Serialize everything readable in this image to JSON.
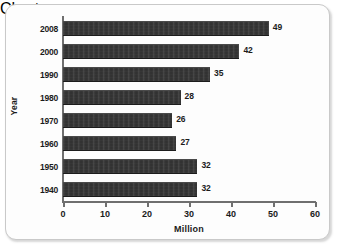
{
  "chart_data": {
    "type": "bar",
    "orientation": "horizontal",
    "title": "",
    "subtitle": "",
    "xlabel": "Million",
    "ylabel": "Year",
    "categories": [
      "2008",
      "2000",
      "1990",
      "1980",
      "1970",
      "1960",
      "1950",
      "1940"
    ],
    "values": [
      49,
      42,
      35,
      28,
      26,
      27,
      32,
      32
    ],
    "data_labels": [
      "49",
      "42",
      "35",
      "28",
      "26",
      "27",
      "32",
      "32"
    ],
    "xlim": [
      0,
      60
    ],
    "xticks": [
      0,
      10,
      20,
      30,
      40,
      50,
      60
    ],
    "xtick_labels": [
      "0",
      "10",
      "20",
      "30",
      "40",
      "50",
      "60"
    ],
    "grid": false,
    "legend": null,
    "bar_color": "#2f2f2f",
    "axis_color": "#6f6f6f",
    "text_color": "#1b1b1b",
    "background": "#fdfdfd"
  }
}
